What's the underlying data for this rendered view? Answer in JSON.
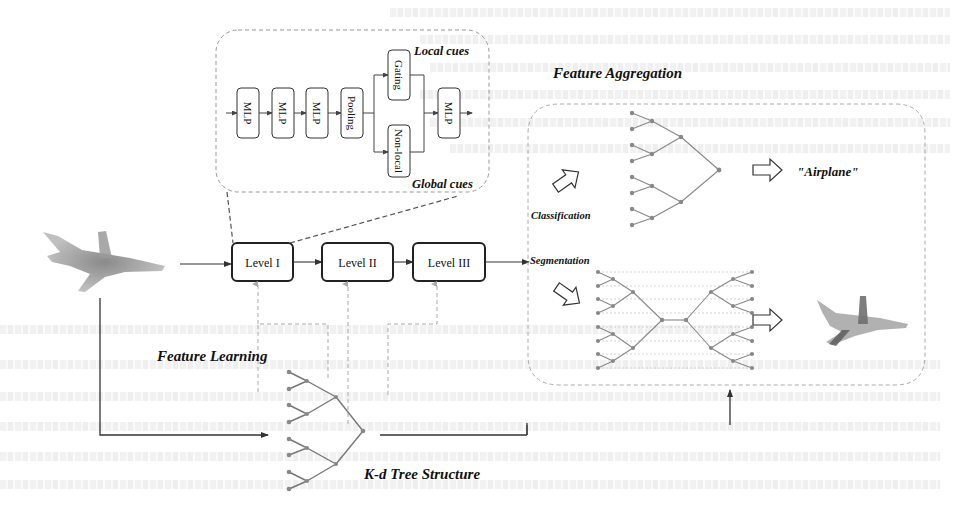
{
  "figure": {
    "inset": {
      "blocks": [
        "MLP",
        "MLP",
        "MLP",
        "Pooling"
      ],
      "branch_top": "Gating",
      "branch_bottom": "Non-local",
      "final_block": "MLP",
      "label_local": "Local cues",
      "label_global": "Global cues"
    },
    "levels": [
      "Level I",
      "Level II",
      "Level III"
    ],
    "labels": {
      "feature_aggregation": "Feature Aggregation",
      "feature_learning": "Feature Learning",
      "kd_tree": "K-d Tree Structure",
      "classification": "Classification",
      "segmentation": "Segmentation",
      "output_class": "\"Airplane\""
    },
    "icons": {
      "input_point_cloud": "airplane-point-cloud",
      "output_point_cloud": "segmented-airplane-point-cloud",
      "hollow_arrow": "hollow-right-arrow"
    },
    "colors": {
      "stroke_dark": "#222222",
      "stroke_gray": "#8a8a8a",
      "dashed_gray": "#a8a8a8",
      "node_gray": "#888888",
      "background": "#ffffff"
    }
  }
}
